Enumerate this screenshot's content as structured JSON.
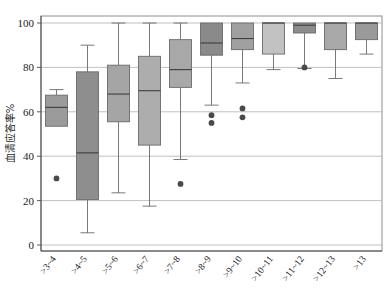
{
  "chart_data": {
    "type": "box",
    "title": "",
    "xlabel": "",
    "ylabel": "血清应答率%",
    "ylim": [
      0,
      105
    ],
    "yticks": [
      0,
      20,
      40,
      60,
      80,
      100
    ],
    "grid": true,
    "legend": "none",
    "categories": [
      ">3~4",
      ">4~5",
      ">5~6",
      ">6~7",
      ">7~8",
      ">8~9",
      ">9~10",
      ">10~11",
      ">11~12",
      ">12~13",
      ">13"
    ],
    "boxes": [
      {
        "category": ">3~4",
        "min": 64.5,
        "q1": 53.5,
        "median": 62.0,
        "q3": 67.5,
        "max": 70.0,
        "whisker_low": 53.5,
        "whisker_high": 70.0,
        "outliers": [
          30.0
        ],
        "fill": "#9b9b9b"
      },
      {
        "category": ">4~5",
        "min": 5.5,
        "q1": 20.5,
        "median": 41.5,
        "q3": 78.0,
        "max": 90.0,
        "whisker_low": 5.5,
        "whisker_high": 90.0,
        "outliers": [],
        "fill": "#8e8e8e"
      },
      {
        "category": ">5~6",
        "min": 23.5,
        "q1": 55.5,
        "median": 68.0,
        "q3": 81.0,
        "max": 100.0,
        "whisker_low": 23.5,
        "whisker_high": 100.0,
        "outliers": [],
        "fill": "#a5a5a5"
      },
      {
        "category": ">6~7",
        "min": 17.5,
        "q1": 45.0,
        "median": 69.5,
        "q3": 85.0,
        "max": 100.0,
        "whisker_low": 17.5,
        "whisker_high": 100.0,
        "outliers": [],
        "fill": "#adadad"
      },
      {
        "category": ">7~8",
        "min": 38.5,
        "q1": 71.0,
        "median": 79.0,
        "q3": 92.5,
        "max": 100.0,
        "whisker_low": 38.5,
        "whisker_high": 100.0,
        "outliers": [
          27.5
        ],
        "fill": "#a8a8a8"
      },
      {
        "category": ">8~9",
        "min": 63.0,
        "q1": 85.5,
        "median": 91.0,
        "q3": 100.0,
        "max": 100.0,
        "whisker_low": 63.0,
        "whisker_high": 100.0,
        "outliers": [
          58.5,
          55.0
        ],
        "fill": "#8a8a8a"
      },
      {
        "category": ">9~10",
        "min": 73.0,
        "q1": 88.0,
        "median": 93.0,
        "q3": 100.0,
        "max": 100.0,
        "whisker_low": 73.0,
        "whisker_high": 100.0,
        "outliers": [
          61.5,
          57.5
        ],
        "fill": "#a0a0a0"
      },
      {
        "category": ">10~11",
        "min": 79.0,
        "q1": 86.0,
        "median": 100.0,
        "q3": 100.0,
        "max": 100.0,
        "whisker_low": 79.0,
        "whisker_high": 100.0,
        "outliers": [],
        "fill": "#c2c2c2"
      },
      {
        "category": ">11~12",
        "min": 79.5,
        "q1": 95.5,
        "median": 99.0,
        "q3": 100.0,
        "max": 100.0,
        "whisker_low": 79.5,
        "whisker_high": 100.0,
        "outliers": [
          80.0
        ],
        "fill": "#8c8c8c"
      },
      {
        "category": ">12~13",
        "min": 75.0,
        "q1": 88.0,
        "median": 100.0,
        "q3": 100.0,
        "max": 100.0,
        "whisker_low": 75.0,
        "whisker_high": 100.0,
        "outliers": [],
        "fill": "#a8a8a8"
      },
      {
        "category": ">13",
        "min": 86.0,
        "q1": 92.5,
        "median": 100.0,
        "q3": 100.0,
        "max": 100.0,
        "whisker_low": 86.0,
        "whisker_high": 100.0,
        "outliers": [],
        "fill": "#9a9a9a"
      }
    ]
  },
  "axis": {
    "y_title": "血清应答率%",
    "y_tick_labels": [
      "100",
      "80",
      "60",
      "40",
      "20",
      "0"
    ],
    "x_tick_labels": [
      ">3~4",
      ">4~5",
      ">5~6",
      ">6~7",
      ">7~8",
      ">8~9",
      ">9~10",
      ">10~11",
      ">11~12",
      ">12~13",
      ">13"
    ]
  },
  "colors": {
    "grid": "#b9b9b9",
    "axis": "#8e8e8e",
    "box_stroke": "#6a6a6a",
    "median": "#3d3d3d",
    "outlier": "#4a4a4a",
    "background": "#ffffff"
  }
}
